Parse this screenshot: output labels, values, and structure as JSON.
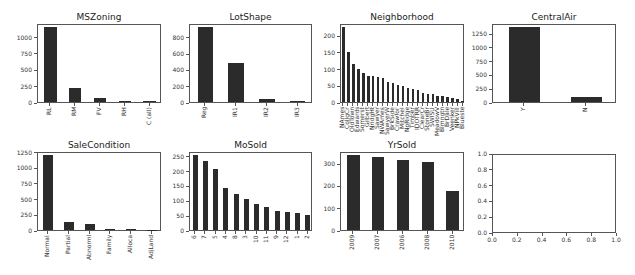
{
  "figure": {
    "background": "#ffffff",
    "bar_color": "#2b2b2b"
  },
  "chart_data": [
    {
      "type": "bar",
      "title": "MSZoning",
      "categories": [
        "RL",
        "RM",
        "FV",
        "RH",
        "C (all)"
      ],
      "values": [
        1151,
        218,
        65,
        16,
        10
      ],
      "yticks": [
        0,
        250,
        500,
        750,
        1000
      ],
      "ylim": [
        0,
        1209
      ],
      "box": {
        "left": 37,
        "top": 24,
        "right": 161,
        "bottom": 103
      }
    },
    {
      "type": "bar",
      "title": "LotShape",
      "categories": [
        "Reg",
        "IR1",
        "IR2",
        "IR3"
      ],
      "values": [
        925,
        484,
        41,
        10
      ],
      "yticks": [
        0,
        200,
        400,
        600,
        800
      ],
      "ylim": [
        0,
        971
      ],
      "box": {
        "left": 189,
        "top": 24,
        "right": 312,
        "bottom": 103
      }
    },
    {
      "type": "bar",
      "title": "Neighborhood",
      "categories": [
        "NAmes",
        "CollgCr",
        "OldTown",
        "Edwards",
        "Somerst",
        "Gilbert",
        "NridgHt",
        "Sawyer",
        "NWAmes",
        "SawyerW",
        "BrkSide",
        "Crawfor",
        "Mitchel",
        "NoRidge",
        "Timber",
        "IDOTRR",
        "ClearCr",
        "StoneBr",
        "SWISU",
        "MeadowV",
        "Blmngtn",
        "BrDale",
        "Veenker",
        "NPkVill",
        "Blueste"
      ],
      "values": [
        225,
        150,
        113,
        100,
        86,
        79,
        77,
        74,
        73,
        59,
        58,
        51,
        49,
        41,
        38,
        37,
        28,
        25,
        25,
        17,
        17,
        16,
        11,
        9,
        2
      ],
      "yticks": [
        0,
        50,
        100,
        150,
        200
      ],
      "ylim": [
        0,
        236
      ],
      "box": {
        "left": 340,
        "top": 24,
        "right": 464,
        "bottom": 103
      }
    },
    {
      "type": "bar",
      "title": "CentralAir",
      "categories": [
        "Y",
        "N"
      ],
      "values": [
        1365,
        95
      ],
      "yticks": [
        0,
        250,
        500,
        750,
        1000,
        1250
      ],
      "ylim": [
        0,
        1433
      ],
      "box": {
        "left": 492,
        "top": 24,
        "right": 616,
        "bottom": 103
      }
    },
    {
      "type": "bar",
      "title": "SaleCondition",
      "categories": [
        "Normal",
        "Partial",
        "Abnorml",
        "Family",
        "Alloca",
        "AdjLand"
      ],
      "values": [
        1198,
        125,
        101,
        20,
        12,
        4
      ],
      "yticks": [
        0,
        250,
        500,
        750,
        1000,
        1250
      ],
      "ylim": [
        0,
        1258
      ],
      "box": {
        "left": 37,
        "top": 152,
        "right": 161,
        "bottom": 231
      }
    },
    {
      "type": "bar",
      "title": "MoSold",
      "categories": [
        "6",
        "7",
        "5",
        "4",
        "8",
        "3",
        "10",
        "11",
        "9",
        "12",
        "1",
        "2"
      ],
      "values": [
        253,
        234,
        204,
        141,
        122,
        106,
        89,
        79,
        63,
        59,
        58,
        52
      ],
      "yticks": [
        0,
        50,
        100,
        150,
        200,
        250
      ],
      "ylim": [
        0,
        266
      ],
      "box": {
        "left": 189,
        "top": 152,
        "right": 312,
        "bottom": 231
      }
    },
    {
      "type": "bar",
      "title": "YrSold",
      "categories": [
        "2009",
        "2007",
        "2006",
        "2008",
        "2010"
      ],
      "values": [
        338,
        329,
        314,
        304,
        175
      ],
      "yticks": [
        0,
        100,
        200,
        300
      ],
      "ylim": [
        0,
        355
      ],
      "box": {
        "left": 340,
        "top": 152,
        "right": 464,
        "bottom": 231
      }
    },
    {
      "type": "empty",
      "title": "",
      "categories": [],
      "values": [],
      "yticks": [
        "0.0",
        "0.2",
        "0.4",
        "0.6",
        "0.8",
        "1.0"
      ],
      "xticks": [
        "0.0",
        "0.2",
        "0.4",
        "0.6",
        "0.8",
        "1.0"
      ],
      "xlim": [
        0,
        1
      ],
      "ylim": [
        0,
        1
      ],
      "box": {
        "left": 492,
        "top": 154,
        "right": 616,
        "bottom": 233
      }
    }
  ]
}
